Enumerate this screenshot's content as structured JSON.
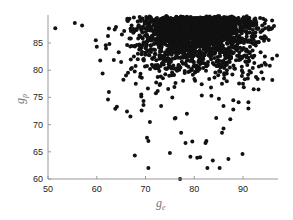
{
  "chart_data": {
    "type": "scatter",
    "title": "",
    "xlabel": "g_e",
    "ylabel": "g_p",
    "xlim": [
      50,
      97
    ],
    "ylim": [
      60,
      90
    ],
    "xticks": [
      50,
      60,
      70,
      80,
      90
    ],
    "yticks": [
      60,
      65,
      70,
      75,
      80,
      85
    ],
    "grid": false,
    "legend": null,
    "marker_color": "#111111",
    "marker_radius": 2,
    "dense_cluster": {
      "description": "Dense cloud of several thousand points saturating near top (g_p 82-90), spanning g_e ~66-93, thinning downward",
      "count": 2200,
      "x_mean": 80.5,
      "x_sd": 6.0,
      "y_max": 90,
      "y_decay": 3.2,
      "seed": 7
    },
    "sparse_points": [
      [
        51.5,
        87.7
      ],
      [
        55.5,
        88.7
      ],
      [
        57.0,
        88.2
      ],
      [
        59.8,
        85.5
      ],
      [
        60.0,
        84.3
      ],
      [
        61.9,
        84.0
      ],
      [
        62.3,
        86.3
      ],
      [
        62.6,
        84.8
      ],
      [
        60.7,
        81.8
      ],
      [
        61.2,
        79.4
      ],
      [
        62.5,
        76.0
      ],
      [
        62.3,
        74.6
      ],
      [
        63.8,
        72.9
      ],
      [
        66.2,
        72.4
      ],
      [
        66.9,
        71.5
      ],
      [
        67.8,
        64.3
      ],
      [
        69.2,
        72.6
      ],
      [
        69.6,
        73.6
      ],
      [
        70.3,
        67.6
      ],
      [
        70.6,
        67.0
      ],
      [
        70.6,
        62.0
      ],
      [
        70.9,
        70.5
      ],
      [
        75.0,
        64.8
      ],
      [
        76.0,
        71.1
      ],
      [
        77.3,
        68.5
      ],
      [
        77.1,
        60.0
      ],
      [
        78.2,
        66.6
      ],
      [
        79.2,
        64.1
      ],
      [
        79.6,
        66.9
      ],
      [
        80.6,
        63.9
      ],
      [
        81.2,
        64.0
      ],
      [
        82.3,
        66.6
      ],
      [
        82.5,
        67.0
      ],
      [
        82.7,
        62.0
      ],
      [
        83.8,
        63.4
      ],
      [
        85.2,
        62.0
      ],
      [
        85.7,
        68.5
      ],
      [
        86.0,
        69.3
      ],
      [
        87.0,
        63.7
      ],
      [
        87.4,
        71.0
      ],
      [
        89.1,
        74.1
      ],
      [
        89.9,
        64.6
      ],
      [
        91.1,
        74.1
      ],
      [
        92.0,
        80.4
      ],
      [
        93.0,
        78.4
      ],
      [
        94.3,
        85.4
      ],
      [
        94.7,
        81.0
      ],
      [
        95.3,
        87.5
      ],
      [
        92.5,
        89.5
      ],
      [
        93.5,
        89.6
      ],
      [
        96.0,
        82.1
      ],
      [
        95.5,
        80.8
      ],
      [
        92.2,
        76.5
      ],
      [
        90.0,
        77.5
      ],
      [
        88.0,
        72.8
      ],
      [
        86.0,
        73.4
      ],
      [
        84.5,
        71.2
      ],
      [
        78.5,
        72.0
      ],
      [
        75.5,
        75.0
      ],
      [
        73.2,
        73.4
      ],
      [
        72.5,
        76.2
      ],
      [
        68.0,
        77.5
      ],
      [
        67.2,
        80.4
      ],
      [
        65.0,
        81.5
      ],
      [
        64.5,
        83.3
      ],
      [
        66.0,
        79.0
      ]
    ]
  }
}
